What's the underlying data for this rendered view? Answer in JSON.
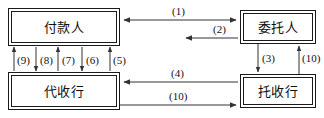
{
  "diagram": {
    "title": "",
    "colors": {
      "line": "#333333",
      "box_border": "#1a1a1a",
      "text": "#111111",
      "background": "#ffffff"
    },
    "nodes": [
      {
        "id": "payer",
        "label": "付款人"
      },
      {
        "id": "client",
        "label": "委托人"
      },
      {
        "id": "collect",
        "label": "代收行"
      },
      {
        "id": "remit",
        "label": "托收行"
      }
    ],
    "edges": [
      {
        "id": "e1",
        "label": "(1)",
        "from": "client",
        "to": "payer",
        "direction": "both",
        "orientation": "horizontal"
      },
      {
        "id": "e2",
        "label": "(2)",
        "from": "client",
        "to": "left",
        "direction": "left",
        "orientation": "horizontal"
      },
      {
        "id": "e3",
        "label": "(3)",
        "from": "client",
        "to": "remit",
        "direction": "down",
        "orientation": "vertical"
      },
      {
        "id": "e10a",
        "label": "(10)",
        "from": "remit",
        "to": "client",
        "direction": "up",
        "orientation": "vertical"
      },
      {
        "id": "e4",
        "label": "(4)",
        "from": "remit",
        "to": "collect",
        "direction": "left",
        "orientation": "horizontal"
      },
      {
        "id": "e10b",
        "label": "(10)",
        "from": "collect",
        "to": "remit",
        "direction": "right",
        "orientation": "horizontal"
      },
      {
        "id": "e5",
        "label": "(5)",
        "from": "collect",
        "to": "payer",
        "direction": "up",
        "orientation": "vertical"
      },
      {
        "id": "e6",
        "label": "(6)",
        "from": "payer",
        "to": "collect",
        "direction": "down",
        "orientation": "vertical"
      },
      {
        "id": "e7",
        "label": "(7)",
        "from": "collect",
        "to": "payer",
        "direction": "up",
        "orientation": "vertical"
      },
      {
        "id": "e8",
        "label": "(8)",
        "from": "payer",
        "to": "collect",
        "direction": "down",
        "orientation": "vertical"
      },
      {
        "id": "e9",
        "label": "(9)",
        "from": "collect",
        "to": "payer",
        "direction": "up",
        "orientation": "vertical"
      }
    ],
    "labels": {
      "l1": "(1)",
      "l2": "(2)",
      "l3": "(3)",
      "l4": "(4)",
      "l5": "(5)",
      "l6": "(6)",
      "l7": "(7)",
      "l8": "(8)",
      "l9": "(9)",
      "l10_vertical": "(10)",
      "l10_horizontal": "(10)"
    }
  }
}
